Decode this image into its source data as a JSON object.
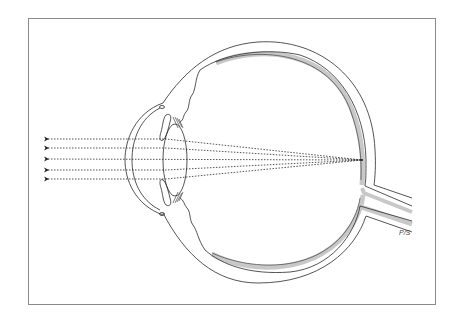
{
  "diagram": {
    "signature": "P/S",
    "rays": {
      "count": 5,
      "style": "dotted",
      "direction": "left-to-right",
      "converge_at": "retina"
    },
    "colors": {
      "line": "#2a2a2a",
      "retina_shade": "#c8c8c8",
      "frame": "#8a8a8a",
      "background": "#ffffff"
    },
    "parts": [
      "cornea",
      "iris",
      "lens",
      "ciliary-body",
      "sclera",
      "retina",
      "optic-nerve",
      "focal-point"
    ]
  }
}
